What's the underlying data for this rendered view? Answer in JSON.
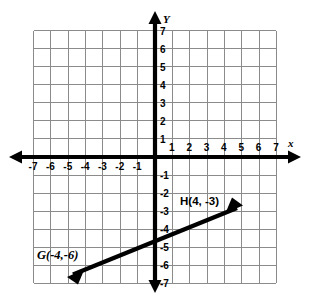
{
  "chart_data": {
    "type": "scatter",
    "title": "",
    "xlabel": "x",
    "ylabel": "Y",
    "xlim": [
      -7,
      7
    ],
    "ylim": [
      -7,
      7
    ],
    "grid": true,
    "legend": "none",
    "x_ticks": [
      "-7",
      "-6",
      "-5",
      "-4",
      "-3",
      "-2",
      "-1",
      "1",
      "2",
      "3",
      "4",
      "5",
      "6",
      "7"
    ],
    "x_tick_values": [
      -7,
      -6,
      -5,
      -4,
      -3,
      -2,
      -1,
      1,
      2,
      3,
      4,
      5,
      6,
      7
    ],
    "y_ticks": [
      "7",
      "6",
      "5",
      "4",
      "3",
      "2",
      "1",
      "-1",
      "-2",
      "-3",
      "-4",
      "-5",
      "-6",
      "-7"
    ],
    "y_tick_values": [
      7,
      6,
      5,
      4,
      3,
      2,
      1,
      -1,
      -2,
      -3,
      -4,
      -5,
      -6,
      -7
    ],
    "points": [
      {
        "name": "G",
        "label": "G(-4,-6)",
        "x": -4,
        "y": -6
      },
      {
        "name": "H",
        "label": "H(4, -3)",
        "x": 4,
        "y": -3
      }
    ],
    "series": [
      {
        "name": "line-GH",
        "kind": "double-arrow-line",
        "through": [
          [
            -4,
            -6
          ],
          [
            4,
            -3
          ]
        ],
        "slope": 0.375,
        "y_intercept": -4.5,
        "arrow_start": [
          -4.85,
          -6.3
        ],
        "arrow_end": [
          4.85,
          -2.7
        ]
      }
    ],
    "annotations": [
      {
        "id": "label-G",
        "text": "G(-4,-6)",
        "x": -5.6,
        "y": -5.05
      },
      {
        "id": "label-H",
        "text": "H(4, -3)",
        "x": 1.45,
        "y": -2.45
      }
    ],
    "colors": {
      "axis": "#000000",
      "grid": "#8b8b8b",
      "line": "#000000",
      "background": "#ffffff",
      "text": "#000000"
    }
  },
  "axis_labels": {
    "x": "x",
    "y": "Y"
  }
}
